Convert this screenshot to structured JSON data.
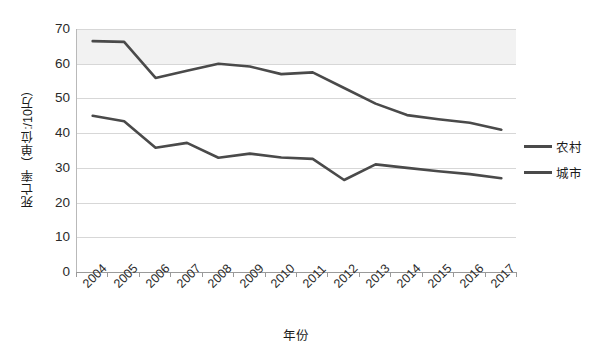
{
  "chart_data": {
    "type": "line",
    "title": "",
    "xlabel": "年份",
    "ylabel": "死亡率（单位:/10万）",
    "categories": [
      "2004",
      "2005",
      "2006",
      "2007",
      "2008",
      "2009",
      "2010",
      "2011",
      "2012",
      "2013",
      "2014",
      "2015",
      "2016",
      "2017"
    ],
    "x": [
      2004,
      2005,
      2006,
      2007,
      2008,
      2009,
      2010,
      2011,
      2012,
      2013,
      2014,
      2015,
      2016,
      2017
    ],
    "series": [
      {
        "name": "农村",
        "color": "#4a4a4a",
        "values": [
          66.5,
          66.3,
          55.9,
          58.0,
          60.0,
          59.2,
          57.0,
          57.5,
          53.0,
          48.5,
          45.2,
          44.0,
          43.0,
          41.0
        ]
      },
      {
        "name": "城市",
        "color": "#4a4a4a",
        "values": [
          45.0,
          43.4,
          35.8,
          37.2,
          32.9,
          34.1,
          33.0,
          32.6,
          26.5,
          31.0,
          30.0,
          29.0,
          28.2,
          27.0
        ]
      }
    ],
    "ylim": [
      0,
      70
    ],
    "yticks": [
      0,
      10,
      20,
      30,
      40,
      50,
      60,
      70
    ],
    "ytick_labels": [
      "0",
      "10",
      "20",
      "30",
      "40",
      "50",
      "60",
      "70"
    ],
    "grid": true,
    "legend_position": "right",
    "legend_entries": [
      "农村",
      "城市"
    ]
  },
  "axes": {
    "y_title": "死亡率（单位:/10万）",
    "x_title": "年份"
  }
}
